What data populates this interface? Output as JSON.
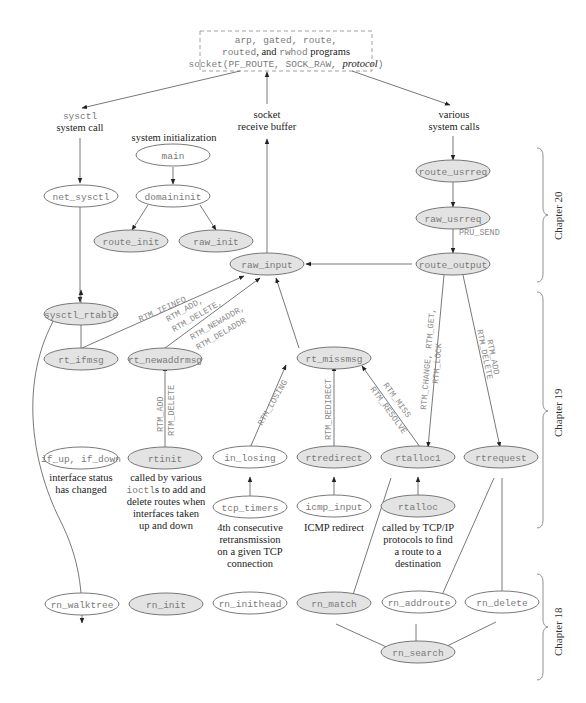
{
  "title_box": {
    "line1": "arp, gated, route,",
    "line2_a": "routed",
    "line2_b": ", and ",
    "line2_c": "rwhod",
    "line2_d": " programs",
    "line3_a": "socket(PF_ROUTE, SOCK_RAW, ",
    "line3_b": "protocol",
    "line3_c": ")"
  },
  "annotations": {
    "sysctl_a": "sysctl",
    "sysctl_b": "system call",
    "socket_a": "socket",
    "socket_b": "receive buffer",
    "various_a": "various",
    "various_b": "system calls",
    "sysinit": "system initialization",
    "ifchg_a": "interface status",
    "ifchg_b": "has changed",
    "rtinit_a": "called by various",
    "rtinit_b1": "ioctl",
    "rtinit_b2": "s to add and",
    "rtinit_c": "delete routes when",
    "rtinit_d": "interfaces taken",
    "rtinit_e": "up and down",
    "tcp_a": "4th consecutive",
    "tcp_b": "retransmission",
    "tcp_c": "on a given TCP",
    "tcp_d": "connection",
    "icmp_a": "ICMP redirect",
    "rtalloc_a": "called by TCP/IP",
    "rtalloc_b": "protocols to find",
    "rtalloc_c": "a route to a",
    "rtalloc_d": "destination"
  },
  "nodes": {
    "main": "main",
    "domaininit": "domaininit",
    "route_init": "route_init",
    "raw_init": "raw_init",
    "net_sysctl": "net_sysctl",
    "sysctl_rtable": "sysctl_rtable",
    "raw_input": "raw_input",
    "route_usrreq": "route_usrreq",
    "raw_usrreq": "raw_usrreq",
    "route_output": "route_output",
    "rt_ifmsg": "rt_ifmsg",
    "rt_newaddrmsg": "rt_newaddrmsg",
    "rt_missmsg": "rt_missmsg",
    "if_up_down": "if_up, if_down",
    "rtinit": "rtinit",
    "in_losing": "in_losing",
    "rtredirect": "rtredirect",
    "rtalloc1": "rtalloc1",
    "rtrequest": "rtrequest",
    "tcp_timers": "tcp_timers",
    "icmp_input": "icmp_input",
    "rtalloc": "rtalloc",
    "rn_walktree": "rn_walktree",
    "rn_init": "rn_init",
    "rn_inithead": "rn_inithead",
    "rn_match": "rn_match",
    "rn_addroute": "rn_addroute",
    "rn_delete": "rn_delete",
    "rn_search": "rn_search"
  },
  "edge_labels": {
    "pru_send": "PRU_SEND",
    "ifinfo": "RTM_IFINFO",
    "newaddr_1": "RTM_ADD,",
    "newaddr_2": "RTM_DELETE,",
    "newaddr_3": "RTM_NEWADDR,",
    "newaddr_4": "RTM_DELADDR",
    "rtinit_1": "RTM_ADD",
    "rtinit_2": "RTM_DELETE",
    "losing": "RTM_LOSING",
    "redirect": "RTM_REDIRECT",
    "miss_1": "RTM_MISS",
    "miss_2": "RTM_RESOLVE",
    "change_1": "RTM_CHANGE, RTM_GET,",
    "change_2": "RTM_LOCK",
    "req_1": "RTM_ADD",
    "req_2": "RTM_DELETE"
  },
  "chapters": {
    "ch20": "Chapter 20",
    "ch19": "Chapter 19",
    "ch18": "Chapter 18"
  },
  "colors": {
    "shaded_node": "#e3e3e3",
    "plain_node": "#ffffff",
    "stroke": "#6a6a6a",
    "code_text": "#7a7a7a"
  }
}
